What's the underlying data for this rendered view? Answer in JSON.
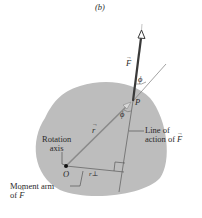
{
  "figure": {
    "panel_label": "(b)",
    "labels": {
      "force": "F",
      "phi_top": "ϕ",
      "phi_bottom": "ϕ",
      "point_p": "P",
      "radius": "r",
      "origin": "O",
      "r_perp": "r⊥",
      "rotation_axis_line1": "Rotation",
      "rotation_axis_line2": "axis",
      "line_of_action_line1": "Line of",
      "line_of_action_line2_prefix": "action of ",
      "line_of_action_vec": "F",
      "moment_arm_line1": "Moment arm",
      "moment_arm_line2_prefix": "of ",
      "moment_arm_vec": "F"
    },
    "colors": {
      "body_fill": "#bdbdbd",
      "force_line": "#3a3a3a",
      "thin_line": "#6a6a6a",
      "text": "#2a2a2a",
      "background": "#ffffff"
    }
  }
}
